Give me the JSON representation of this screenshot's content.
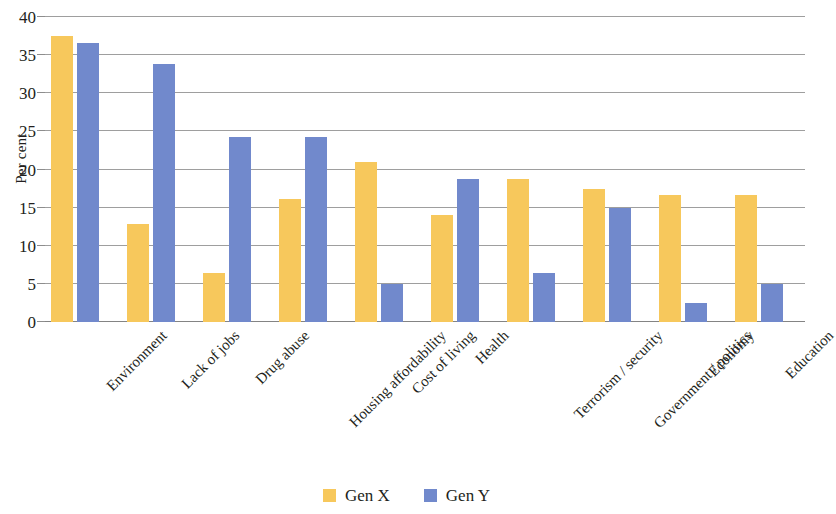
{
  "chart_data": {
    "type": "bar",
    "title": "",
    "subtitle": "",
    "xlabel": "",
    "ylabel": "Per cent",
    "ylim": [
      0,
      40
    ],
    "ytick_step": 5,
    "yticks": [
      0,
      5,
      10,
      15,
      20,
      25,
      30,
      35,
      40
    ],
    "grid": true,
    "grid_axis": "y",
    "legend_position": "bottom",
    "orientation": "vertical",
    "grouping": "clustered",
    "categories": [
      "Environment",
      "Lack of jobs",
      "Drug abuse",
      "Housing affordability",
      "Cost of living",
      "Health",
      "Terrorism / security",
      "Government / politics",
      "Economy",
      "Education"
    ],
    "series": [
      {
        "name": "Gen X",
        "color": "#F7C85C",
        "values": [
          37.5,
          12.9,
          6.4,
          16.1,
          21.0,
          14.0,
          18.8,
          17.5,
          16.7,
          16.7
        ]
      },
      {
        "name": "Gen Y",
        "color": "#7189CC",
        "values": [
          36.6,
          33.8,
          24.3,
          24.3,
          5.0,
          18.8,
          6.4,
          15.0,
          2.5,
          5.0
        ]
      }
    ]
  },
  "axes": {
    "y_title": "Per cent",
    "y_tick_labels": [
      "0",
      "5",
      "10",
      "15",
      "20",
      "25",
      "30",
      "35",
      "40"
    ]
  },
  "legend": {
    "items": [
      {
        "label": "Gen X",
        "color": "#F7C85C"
      },
      {
        "label": "Gen Y",
        "color": "#7189CC"
      }
    ]
  },
  "colors": {
    "gen_x": "#F7C85C",
    "gen_y": "#7189CC",
    "gridline": "#8d8d8d",
    "text": "#231f20",
    "background": "#ffffff"
  }
}
